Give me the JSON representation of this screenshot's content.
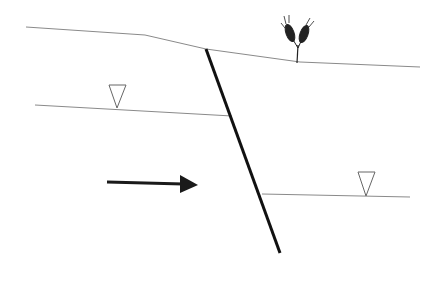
{
  "diagram": {
    "type": "geological-cross-section",
    "elements": {
      "ground_surface": {
        "label": "",
        "color": "#8a8a8a"
      },
      "fault": {
        "label": "",
        "color": "#111111"
      },
      "water_table_left": {
        "label": "",
        "symbol": "inverted-triangle"
      },
      "water_table_right": {
        "label": "",
        "symbol": "inverted-triangle"
      },
      "flow_arrow": {
        "label": "",
        "direction": "right",
        "color": "#1a1a1a"
      },
      "vegetation": {
        "label": "",
        "icon": "wheat-plant-icon"
      }
    }
  }
}
